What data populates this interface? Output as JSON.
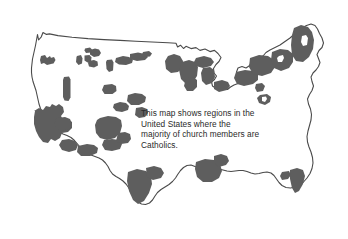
{
  "figure": {
    "name": "catholic-majority-regions-map",
    "background_color": "#ffffff"
  },
  "caption": {
    "text": "This map shows regions in the\nUnited States where the\nmajority of church members are\nCatholics.",
    "lines": [
      "This map shows regions in the",
      "United States where the",
      "majority of church members are",
      "Catholics."
    ],
    "color": "#2a2a2a"
  },
  "map": {
    "title": "United States",
    "outline_color": "#4a4a4a",
    "fill_color": "#ffffff",
    "shading_color": "#5e5e5e",
    "shaded_meaning": "majority of church members are Catholics",
    "regions_shaded": [
      "Northern Washington",
      "Western Montana",
      "Central Montana",
      "North Dakota",
      "Northern Idaho",
      "Central Idaho",
      "Eastern Oregon",
      "Northern California",
      "California",
      "Southern Arizona",
      "New Mexico",
      "Southern Colorado",
      "Nebraska",
      "Kansas",
      "Minnesota",
      "Wisconsin",
      "Michigan",
      "Illinois",
      "Ohio",
      "New York",
      "New England",
      "Maine",
      "Pennsylvania",
      "New Jersey",
      "Southern Texas",
      "Gulf Coast Louisiana",
      "Southern Florida"
    ]
  }
}
